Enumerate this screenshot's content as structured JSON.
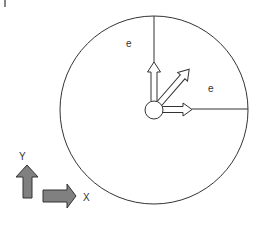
{
  "diagram": {
    "labels": {
      "e_top": "e",
      "e_right": "e",
      "axis_y": "Y",
      "axis_x": "X"
    },
    "colors": {
      "stroke": "#333333",
      "axis_arrow_fill": "#808080",
      "background": "#ffffff"
    },
    "geometry": {
      "outer_circle": {
        "cx": 154,
        "cy": 110,
        "r": 94
      },
      "hub_circle": {
        "cx": 154,
        "cy": 110,
        "r": 9
      }
    }
  }
}
